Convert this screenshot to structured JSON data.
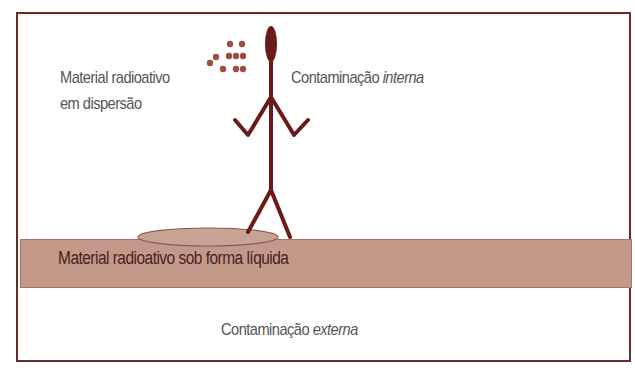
{
  "diagram": {
    "labels": {
      "dispersion_line1": "Material radioativo",
      "dispersion_line2": "em dispersão",
      "internal_prefix": "Contaminação ",
      "internal_emph": "interna",
      "liquid": "Material radioativo sob forma líquida",
      "external_prefix": "Contaminação ",
      "external_emph": "externa"
    },
    "colors": {
      "border": "#6b2a2a",
      "figure": "#6b1a1a",
      "ground": "#c4998a",
      "particles": "#9a5040",
      "text": "#555555"
    }
  }
}
